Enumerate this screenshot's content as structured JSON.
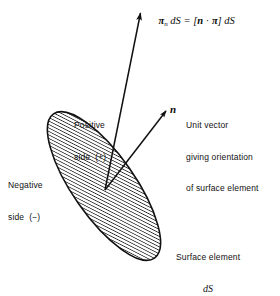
{
  "figure": {
    "type": "diagram",
    "title_equation": {
      "pi_symbol": "π",
      "subscript": "n",
      "parts": [
        "π",
        "n",
        " dS = [",
        "n",
        " · ",
        "π",
        "] dS"
      ],
      "plain": "πn dS = [n · π] dS"
    },
    "labels": {
      "positive_side_line1": "Positive",
      "positive_side_line2": "side  (+)",
      "negative_side_line1": "Negative",
      "negative_side_line2": "side  (−)",
      "unit_vector_line1": "Unit vector",
      "unit_vector_line2": "giving orientation",
      "unit_vector_line3": "of surface element",
      "surface_element_line1": "Surface element",
      "surface_element_line2": "dS",
      "normal_vector": "n"
    },
    "colors": {
      "background": "#ffffff",
      "stroke": "#111111",
      "hatch": "#2b2b2b",
      "fill": "#ffffff"
    },
    "geometry": {
      "ellipse_center_x": 104,
      "ellipse_center_y": 186,
      "ellipse_rx": 88,
      "ellipse_ry": 31,
      "ellipse_rotation_deg": 55,
      "traction_arrow_from": [
        105,
        190
      ],
      "traction_arrow_to": [
        139,
        11
      ],
      "normal_arrow_from": [
        105,
        190
      ],
      "normal_arrow_to": [
        167,
        110
      ],
      "hatch_angle_deg": 62
    }
  }
}
